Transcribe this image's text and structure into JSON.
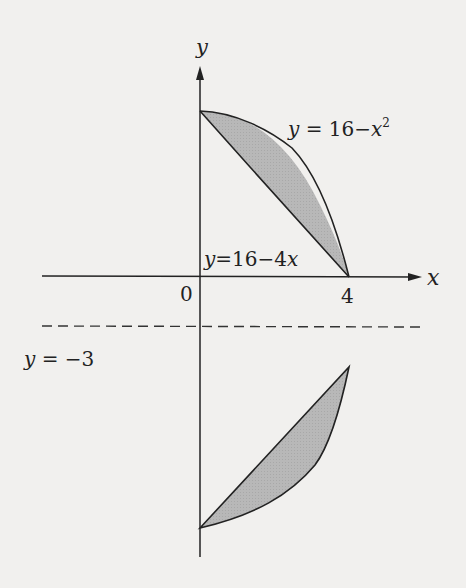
{
  "diagram": {
    "type": "region_revolution_diagram",
    "axes": {
      "x_label": "x",
      "y_label": "y",
      "origin_label": "0",
      "x_tick_label": "4"
    },
    "curves": {
      "parabola_label": "y = 16−x²",
      "parabola_label_main": "y = 16−x",
      "parabola_label_exp": "2",
      "line_label": "y=16−4x"
    },
    "axis_of_rotation": {
      "label": "y = −3",
      "style": "dashed"
    },
    "regions": [
      {
        "name": "original-region",
        "between": [
          "y = 16 - x^2",
          "y = 16 - 4x"
        ],
        "x_range": [
          0,
          4
        ]
      },
      {
        "name": "reflected-region",
        "description": "mirror of region across y = -3"
      }
    ],
    "colors": {
      "background": "#f1f0ee",
      "stroke": "#222222",
      "fill": "#b4b4b4"
    }
  }
}
